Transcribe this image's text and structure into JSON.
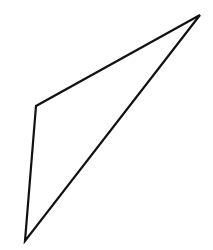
{
  "diagram": {
    "type": "triangle",
    "canvas": {
      "width": 213,
      "height": 250,
      "background": "#ffffff"
    },
    "stroke_color": "#111111",
    "stroke_width": 2.2,
    "fill": "none",
    "vertices": [
      {
        "label": "",
        "x": 200,
        "y": 15
      },
      {
        "label": "",
        "x": 36,
        "y": 106
      },
      {
        "label": "",
        "x": 25,
        "y": 241
      }
    ]
  }
}
